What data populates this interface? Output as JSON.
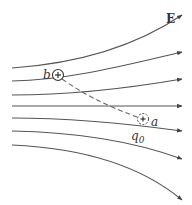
{
  "diagram": {
    "labels": {
      "field": "E",
      "point_b": "b",
      "point_a": "a",
      "test_charge": "q",
      "test_charge_subscript": "0",
      "charge_sign": "+"
    },
    "field_lines": [
      {
        "id": "line-1",
        "start": [
          12,
          68
        ],
        "end": [
          182,
          15
        ]
      },
      {
        "id": "line-2",
        "start": [
          12,
          81
        ],
        "end": [
          182,
          52
        ]
      },
      {
        "id": "line-3",
        "start": [
          12,
          95
        ],
        "end": [
          182,
          79
        ]
      },
      {
        "id": "line-4",
        "start": [
          12,
          106
        ],
        "end": [
          182,
          106
        ]
      },
      {
        "id": "line-5",
        "start": [
          12,
          118
        ],
        "end": [
          182,
          131
        ]
      },
      {
        "id": "line-6",
        "start": [
          12,
          131
        ],
        "end": [
          182,
          159
        ]
      },
      {
        "id": "line-7",
        "start": [
          12,
          145
        ],
        "end": [
          182,
          200
        ]
      }
    ],
    "charges": {
      "b": {
        "position": [
          58,
          75
        ],
        "style": "solid"
      },
      "a": {
        "position": [
          143,
          119
        ],
        "style": "dashed"
      }
    },
    "path": {
      "from": "b",
      "to": "a",
      "style": "dashed"
    },
    "colors": {
      "lines": "#555555",
      "text": "#333333",
      "background": "#ffffff"
    }
  }
}
